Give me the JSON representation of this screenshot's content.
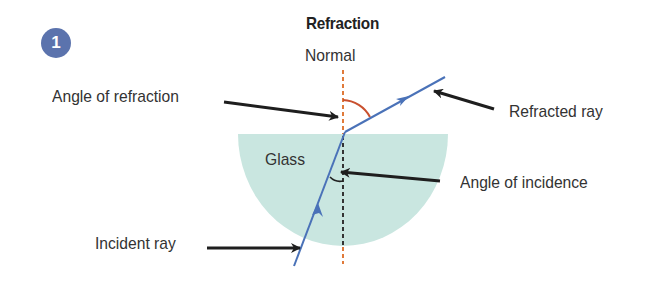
{
  "figure": {
    "number": "1",
    "title": "Refraction"
  },
  "labels": {
    "normal": "Normal",
    "angle_of_refraction": "Angle of refraction",
    "refracted_ray": "Refracted ray",
    "glass": "Glass",
    "angle_of_incidence": "Angle of incidence",
    "incident_ray": "Incident ray"
  },
  "colors": {
    "badge": "#5b73ad",
    "glass_fill": "#c9e6e0",
    "ray": "#4a72b8",
    "normal_outside": "#e07a3a",
    "normal_inside": "#333333",
    "refraction_arc": "#c9502e",
    "pointer_arrow": "#1e1e1e"
  }
}
